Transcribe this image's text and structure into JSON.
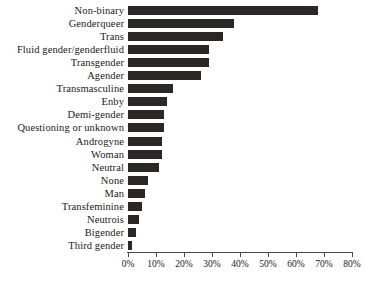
{
  "chart_data": {
    "type": "bar",
    "orientation": "horizontal",
    "title": "",
    "subtitle": "",
    "xlabel": "",
    "ylabel": "",
    "xlim": [
      0,
      80
    ],
    "grid": false,
    "legend": null,
    "bar_color": "#2b2724",
    "axis_color": "#4a4a48",
    "tick_suffix": "%",
    "tick_values": [
      0,
      10,
      20,
      30,
      40,
      50,
      60,
      70,
      80
    ],
    "tick_labels": [
      "0%",
      "10%",
      "20%",
      "30%",
      "40%",
      "50%",
      "60%",
      "70%",
      "80%"
    ],
    "categories": [
      "Non-binary",
      "Genderqueer",
      "Trans",
      "Fluid gender/genderfluid",
      "Transgender",
      "Agender",
      "Transmasculine",
      "Enby",
      "Demi-gender",
      "Questioning or unknown",
      "Androgyne",
      "Woman",
      "Neutral",
      "None",
      "Man",
      "Transfeminine",
      "Neutrois",
      "Bigender",
      "Third gender"
    ],
    "values": [
      68,
      38,
      34,
      29,
      29,
      26,
      16,
      14,
      13,
      13,
      12,
      12,
      11,
      7,
      6,
      5,
      4,
      3,
      1.5
    ]
  }
}
